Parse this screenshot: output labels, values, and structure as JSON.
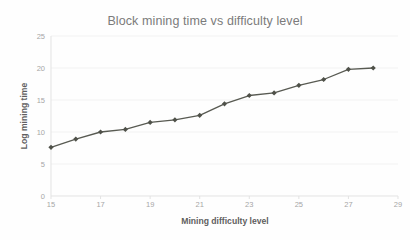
{
  "chart_data": {
    "type": "line",
    "title": "Block mining time vs difficulty level",
    "xlabel": "Mining difficulty level",
    "ylabel": "Log mining time",
    "x": [
      15,
      16,
      17,
      18,
      19,
      20,
      21,
      22,
      23,
      24,
      25,
      26,
      27,
      28
    ],
    "values": [
      7.6,
      8.9,
      10.0,
      10.4,
      11.5,
      11.9,
      12.6,
      14.4,
      15.7,
      16.1,
      17.3,
      18.2,
      19.8,
      20.0
    ],
    "series": [
      {
        "name": "Log mining time",
        "values": [
          7.6,
          8.9,
          10.0,
          10.4,
          11.5,
          11.9,
          12.6,
          14.4,
          15.7,
          16.1,
          17.3,
          18.2,
          19.8,
          20.0
        ]
      }
    ],
    "xlim": [
      15,
      29
    ],
    "ylim": [
      0,
      25
    ],
    "xticks": [
      "15",
      "17",
      "19",
      "21",
      "23",
      "25",
      "27",
      "29"
    ],
    "xtick_values": [
      15,
      17,
      19,
      21,
      23,
      25,
      27,
      29
    ],
    "yticks": [
      "0",
      "5",
      "10",
      "15",
      "20",
      "25"
    ],
    "ytick_values": [
      0,
      5,
      10,
      15,
      20,
      25
    ],
    "grid": "horizontal",
    "legend": "none",
    "marker": "diamond",
    "colors": {
      "line": "#585a52",
      "marker": "#4f5149",
      "grid": "#f2f2f2",
      "axis": "#e3e3e3",
      "tick_label": "#a6a6a6",
      "axis_title": "#5f5f5f",
      "title": "#7b7b7b",
      "background": "#fefefe"
    }
  }
}
